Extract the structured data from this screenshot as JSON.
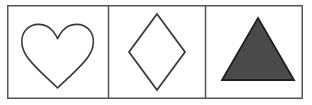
{
  "panel": {
    "name": "shape-comparison-panel",
    "width": 312,
    "height": 105,
    "background_color": "#ffffff",
    "border_color": "#555555",
    "border_width": 1.5,
    "frame": {
      "x": 7,
      "y": 5,
      "width": 296,
      "height": 94
    },
    "divider_color": "#555555",
    "divider_x_positions": [
      108.5,
      205.5
    ],
    "cell_count": 3
  },
  "cells": [
    {
      "index": 1,
      "label": "heart",
      "shape_type": "heart",
      "fill": "none",
      "fill_label": "unfilled",
      "stroke_color": "#3a3a3a",
      "stroke_width": 1.6,
      "bounds": {
        "x": 22,
        "y": 24,
        "width": 71,
        "height": 64
      },
      "center": {
        "x": 57.5,
        "y": 54
      }
    },
    {
      "index": 2,
      "label": "diamond",
      "shape_type": "rhombus",
      "fill": "none",
      "fill_label": "unfilled",
      "stroke_color": "#3a3a3a",
      "stroke_width": 1.8,
      "bounds": {
        "x": 129,
        "y": 14,
        "width": 56,
        "height": 76
      },
      "center": {
        "x": 157,
        "y": 52
      },
      "vertices": "157,14 185,52 157,90 129,52"
    },
    {
      "index": 3,
      "label": "triangle",
      "shape_type": "triangle",
      "fill": "#4a4a4a",
      "fill_label": "filled",
      "stroke_color": "#1f1f1f",
      "stroke_width": 1.8,
      "bounds": {
        "x": 222,
        "y": 18,
        "width": 72,
        "height": 62
      },
      "center": {
        "x": 258,
        "y": 55
      },
      "vertices": "258,18 294,80 222,80"
    }
  ]
}
